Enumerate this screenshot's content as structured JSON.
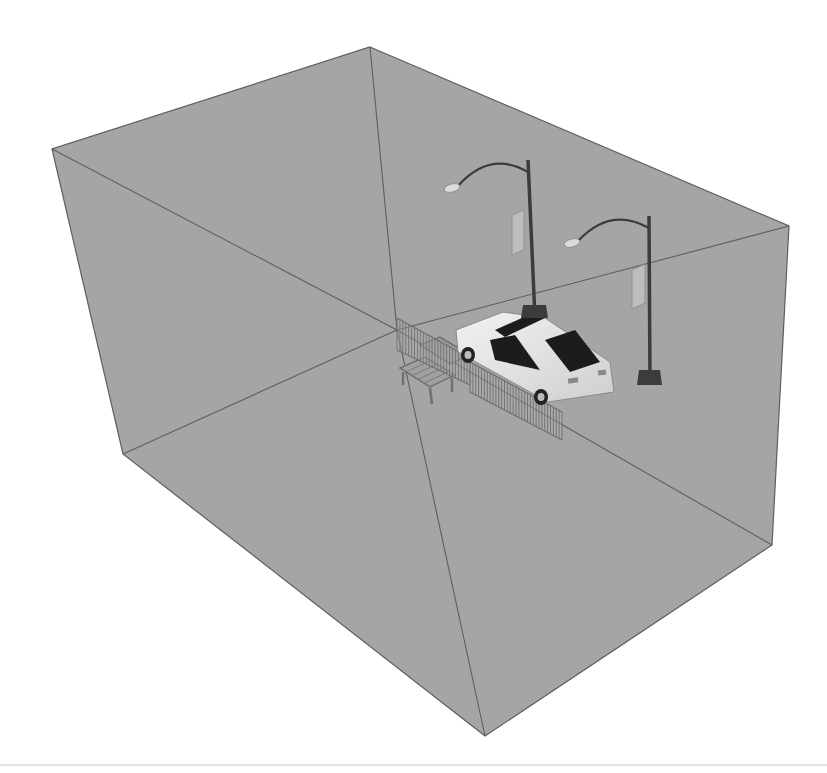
{
  "canvas": {
    "width": 827,
    "height": 773,
    "background": "#ffffff"
  },
  "colors": {
    "box_fill": "#a5a5a5",
    "box_fill_dark": "#9c9c9c",
    "edge": "#5e5e5e",
    "car_body": "#f2f2f2",
    "car_shade": "#cfcfcf",
    "car_glass": "#1c1c1c",
    "pole": "#3c3c3c",
    "banner": "#bdbdbd",
    "lamp_head": "#dcdcdc",
    "fence": "#6e6e6e",
    "bench": "#707070",
    "ground_line": "#c8c8c8"
  },
  "box": {
    "vertices": {
      "top": [
        370,
        47
      ],
      "top_left": [
        52,
        149
      ],
      "right": [
        789,
        226
      ],
      "bottom_left": [
        123,
        454
      ],
      "bottom_right": [
        772,
        545
      ],
      "bottom": [
        485,
        736
      ],
      "hidden": [
        397,
        330
      ]
    },
    "outline": [
      [
        370,
        47
      ],
      [
        789,
        226
      ],
      [
        772,
        545
      ],
      [
        485,
        736
      ],
      [
        123,
        454
      ],
      [
        52,
        149
      ]
    ],
    "hidden_edges": [
      [
        [
          52,
          149
        ],
        [
          397,
          330
        ]
      ],
      [
        [
          789,
          226
        ],
        [
          397,
          330
        ]
      ],
      [
        [
          370,
          47
        ],
        [
          397,
          330
        ]
      ],
      [
        [
          123,
          454
        ],
        [
          397,
          330
        ]
      ],
      [
        [
          772,
          545
        ],
        [
          397,
          330
        ]
      ],
      [
        [
          485,
          736
        ],
        [
          397,
          330
        ]
      ]
    ]
  },
  "ground_line_y": 765,
  "objects": {
    "lamps": [
      {
        "name": "street-lamp-1",
        "pole_top": [
          528,
          160
        ],
        "pole_bottom": [
          535,
          318
        ],
        "arm_end": [
          452,
          188
        ],
        "banner": [
          [
            512,
            215
          ],
          [
            524,
            210
          ],
          [
            524,
            250
          ],
          [
            512,
            255
          ]
        ],
        "base": [
          [
            523,
            305
          ],
          [
            546,
            305
          ],
          [
            548,
            318
          ],
          [
            521,
            318
          ]
        ]
      },
      {
        "name": "street-lamp-2",
        "pole_top": [
          649,
          216
        ],
        "pole_bottom": [
          650,
          383
        ],
        "arm_end": [
          572,
          243
        ],
        "banner": [
          [
            632,
            270
          ],
          [
            645,
            264
          ],
          [
            645,
            303
          ],
          [
            632,
            309
          ]
        ],
        "base": [
          [
            639,
            370
          ],
          [
            660,
            370
          ],
          [
            662,
            385
          ],
          [
            637,
            385
          ]
        ]
      }
    ],
    "car": {
      "body": [
        [
          456,
          330
        ],
        [
          503,
          312
        ],
        [
          545,
          318
        ],
        [
          610,
          362
        ],
        [
          614,
          392
        ],
        [
          548,
          402
        ],
        [
          458,
          352
        ]
      ],
      "rear_window": [
        [
          545,
          340
        ],
        [
          575,
          330
        ],
        [
          600,
          362
        ],
        [
          570,
          372
        ]
      ],
      "side_window": [
        [
          490,
          340
        ],
        [
          515,
          335
        ],
        [
          540,
          370
        ],
        [
          495,
          360
        ]
      ],
      "roof_shadow": [
        [
          495,
          330
        ],
        [
          535,
          312
        ],
        [
          545,
          318
        ],
        [
          505,
          337
        ]
      ],
      "wheels": [
        [
          468,
          355
        ],
        [
          541,
          397
        ]
      ]
    },
    "fences": [
      {
        "name": "fence-left",
        "points": [
          [
            397,
            318
          ],
          [
            397,
            350
          ],
          [
            470,
            385
          ],
          [
            470,
            358
          ]
        ]
      },
      {
        "name": "fence-right",
        "points": [
          [
            470,
            362
          ],
          [
            470,
            392
          ],
          [
            562,
            440
          ],
          [
            562,
            412
          ]
        ]
      }
    ],
    "bench": {
      "seat": [
        [
          400,
          368
        ],
        [
          425,
          357
        ],
        [
          455,
          375
        ],
        [
          430,
          387
        ]
      ],
      "back": [
        [
          420,
          345
        ],
        [
          440,
          337
        ],
        [
          470,
          355
        ],
        [
          450,
          364
        ]
      ],
      "legs": [
        [
          [
            403,
            372
          ],
          [
            403,
            385
          ]
        ],
        [
          [
            430,
            388
          ],
          [
            432,
            404
          ]
        ],
        [
          [
            452,
            378
          ],
          [
            452,
            392
          ]
        ]
      ]
    }
  }
}
